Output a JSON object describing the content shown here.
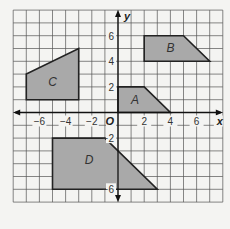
{
  "chart_data": {
    "type": "coordinate-plane",
    "xlabel": "x",
    "ylabel": "y",
    "origin_label": "O",
    "xlim": [
      -8,
      8
    ],
    "ylim": [
      -7,
      8
    ],
    "grid": true,
    "x_ticks": [
      -6,
      -4,
      -2,
      2,
      4,
      6
    ],
    "x_tick_labels": [
      "−6",
      "−4",
      "−2",
      "2",
      "4",
      "6"
    ],
    "y_ticks": [
      6,
      4,
      2,
      -2,
      -6
    ],
    "y_tick_labels": [
      "6",
      "4",
      "2",
      "−2",
      "−6"
    ],
    "shapes": [
      {
        "label": "A",
        "vertices": [
          [
            0,
            0
          ],
          [
            0,
            2
          ],
          [
            2,
            2
          ],
          [
            4,
            0
          ]
        ],
        "label_pos": [
          1.3,
          0.9
        ]
      },
      {
        "label": "B",
        "vertices": [
          [
            2,
            4
          ],
          [
            2,
            6
          ],
          [
            5,
            6
          ],
          [
            7,
            4
          ]
        ],
        "label_pos": [
          4.0,
          5.0
        ]
      },
      {
        "label": "C",
        "vertices": [
          [
            -7,
            1
          ],
          [
            -7,
            3
          ],
          [
            -3,
            5
          ],
          [
            -3,
            1
          ]
        ],
        "label_pos": [
          -5.0,
          2.3
        ]
      },
      {
        "label": "D",
        "vertices": [
          [
            -5,
            -2
          ],
          [
            -1,
            -2
          ],
          [
            3,
            -6
          ],
          [
            -5,
            -6
          ]
        ],
        "label_pos": [
          -2.2,
          -3.8
        ]
      }
    ],
    "fill_color": "#a9a9a9",
    "stroke_color": "#222222",
    "grid_color": "#555555"
  }
}
